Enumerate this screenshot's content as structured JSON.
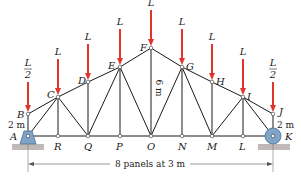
{
  "diagram": {
    "type": "roof-truss",
    "nodes": {
      "A": [
        28,
        136
      ],
      "B": [
        28,
        114
      ],
      "C": [
        58,
        97
      ],
      "D": [
        88,
        82
      ],
      "E": [
        120,
        67
      ],
      "F": [
        151,
        48
      ],
      "G": [
        182,
        67
      ],
      "H": [
        212,
        82
      ],
      "I": [
        243,
        97
      ],
      "J": [
        273,
        114
      ],
      "K": [
        273,
        136
      ],
      "R": [
        58,
        136
      ],
      "Q": [
        88,
        136
      ],
      "P": [
        120,
        136
      ],
      "O": [
        151,
        136
      ],
      "N": [
        182,
        136
      ],
      "M": [
        212,
        136
      ],
      "L": [
        243,
        136
      ]
    },
    "members": [
      [
        "A",
        "B"
      ],
      [
        "B",
        "C"
      ],
      [
        "C",
        "D"
      ],
      [
        "D",
        "E"
      ],
      [
        "E",
        "F"
      ],
      [
        "F",
        "G"
      ],
      [
        "G",
        "H"
      ],
      [
        "H",
        "I"
      ],
      [
        "I",
        "J"
      ],
      [
        "J",
        "K"
      ],
      [
        "A",
        "R"
      ],
      [
        "R",
        "Q"
      ],
      [
        "Q",
        "P"
      ],
      [
        "P",
        "O"
      ],
      [
        "O",
        "N"
      ],
      [
        "N",
        "M"
      ],
      [
        "M",
        "L"
      ],
      [
        "L",
        "K"
      ],
      [
        "A",
        "C"
      ],
      [
        "C",
        "R"
      ],
      [
        "C",
        "Q"
      ],
      [
        "D",
        "Q"
      ],
      [
        "E",
        "Q"
      ],
      [
        "E",
        "P"
      ],
      [
        "E",
        "O"
      ],
      [
        "F",
        "O"
      ],
      [
        "G",
        "O"
      ],
      [
        "G",
        "N"
      ],
      [
        "G",
        "M"
      ],
      [
        "H",
        "M"
      ],
      [
        "I",
        "M"
      ],
      [
        "I",
        "L"
      ],
      [
        "I",
        "K"
      ]
    ],
    "node_labels": [
      {
        "text": "A",
        "x": 10,
        "y": 140
      },
      {
        "text": "B",
        "x": 17,
        "y": 118
      },
      {
        "text": "C",
        "x": 47,
        "y": 98
      },
      {
        "text": "D",
        "x": 78,
        "y": 84
      },
      {
        "text": "E",
        "x": 108,
        "y": 69
      },
      {
        "text": "F",
        "x": 140,
        "y": 51
      },
      {
        "text": "G",
        "x": 186,
        "y": 70
      },
      {
        "text": "H",
        "x": 216,
        "y": 85
      },
      {
        "text": "I",
        "x": 247,
        "y": 100
      },
      {
        "text": "J",
        "x": 279,
        "y": 115
      },
      {
        "text": "K",
        "x": 285,
        "y": 140
      },
      {
        "text": "R",
        "x": 54,
        "y": 150
      },
      {
        "text": "Q",
        "x": 84,
        "y": 150
      },
      {
        "text": "P",
        "x": 116,
        "y": 150
      },
      {
        "text": "O",
        "x": 147,
        "y": 150
      },
      {
        "text": "N",
        "x": 178,
        "y": 150
      },
      {
        "text": "M",
        "x": 207,
        "y": 150
      },
      {
        "text": "L",
        "x": 239,
        "y": 150
      }
    ],
    "loads": [
      {
        "node": "B",
        "label": "L/2",
        "top": 38
      },
      {
        "node": "C",
        "label": "L",
        "top": 30
      },
      {
        "node": "D",
        "label": "L",
        "top": 14
      },
      {
        "node": "E",
        "label": "L",
        "top": -1
      },
      {
        "node": "F",
        "label": "L",
        "top": -16
      },
      {
        "node": "G",
        "label": "L",
        "top": -1
      },
      {
        "node": "H",
        "label": "L",
        "top": 14
      },
      {
        "node": "I",
        "label": "L",
        "top": 30
      },
      {
        "node": "J",
        "label": "L/2",
        "top": 38
      }
    ],
    "dimensions": {
      "left_height": "2 m",
      "right_height": "2 m",
      "center_height": "6 m",
      "span": "8 panels at 3 m"
    },
    "colors": {
      "member": "#1a1a1a",
      "load_arrow": "#e0352b",
      "support_fill": "#7fa4c8",
      "ground": "#8c7f78",
      "dim_line": "#555555"
    }
  }
}
